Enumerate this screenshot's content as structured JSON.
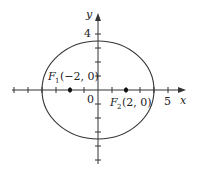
{
  "figure": {
    "type": "ellipse-with-foci",
    "axes": {
      "x_label": "x",
      "y_label": "y",
      "origin_label": "0",
      "x_tick_label": "5",
      "y_tick_label": "4",
      "x_ticks": [
        -6,
        -5,
        -4,
        -3,
        -2,
        -1,
        1,
        2,
        3,
        4,
        5
      ],
      "y_ticks": [
        -5,
        -4,
        -3,
        -2,
        -1,
        1,
        2,
        3,
        4
      ]
    },
    "ellipse": {
      "a": 4,
      "b": 3.46,
      "center": [
        0,
        0
      ]
    },
    "foci": [
      {
        "name": "F",
        "sub": "1",
        "coords": "(−2, 0)",
        "x": -2,
        "y": 0
      },
      {
        "name": "F",
        "sub": "2",
        "coords": "(2, 0)",
        "x": 2,
        "y": 0
      }
    ],
    "colors": {
      "stroke": "#333333",
      "background": "#ffffff"
    }
  }
}
